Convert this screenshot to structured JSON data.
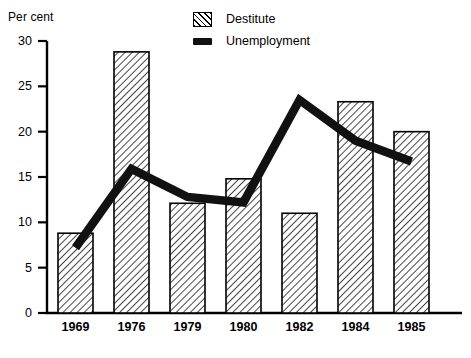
{
  "chart_data": {
    "type": "bar",
    "title": "",
    "xlabel": "",
    "ylabel": "Per cent",
    "ylim": [
      0,
      30
    ],
    "yticks": [
      0,
      5,
      10,
      15,
      20,
      25,
      30
    ],
    "grid": false,
    "legend_position": "top-center",
    "categories": [
      "1969",
      "1976",
      "1979",
      "1980",
      "1982",
      "1984",
      "1985"
    ],
    "series": [
      {
        "name": "Destitute",
        "type": "bar",
        "style": "hatched",
        "values": [
          8.8,
          28.8,
          12.1,
          14.8,
          11.0,
          23.3,
          20.0
        ]
      },
      {
        "name": "Unemployment",
        "type": "line",
        "style": "thick-black",
        "values": [
          7.2,
          15.9,
          12.8,
          12.2,
          23.5,
          19.0,
          16.7
        ]
      }
    ]
  },
  "legend": {
    "items": [
      {
        "label": "Destitute",
        "swatch": "hatched-rect-icon"
      },
      {
        "label": "Unemployment",
        "swatch": "solid-bar-icon"
      }
    ]
  },
  "axis": {
    "y_title": "Per cent"
  }
}
